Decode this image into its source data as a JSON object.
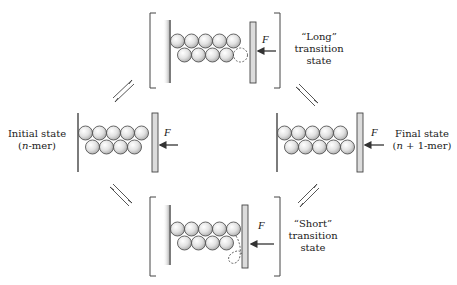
{
  "figure": {
    "type": "reaction-cycle-diagram"
  },
  "states": {
    "initial": {
      "line1": "Initial state",
      "line2": "(n-mer)",
      "line2_prefix": "(",
      "line2_var": "n",
      "line2_suffix": "-mer)",
      "top_row": 5,
      "bottom_row": 4,
      "dashed": 0
    },
    "final": {
      "line1": "Final state",
      "line2_prefix": "(",
      "line2_var": "n",
      "line2_suffix": " + 1-mer)",
      "top_row": 5,
      "bottom_row": 5,
      "dashed": 0
    },
    "long_ts": {
      "line1": "“Long”",
      "line2": "transition",
      "line3": "state",
      "top_row": 5,
      "bottom_row": 4,
      "dashed": 1
    },
    "short_ts": {
      "line1": "“Short”",
      "line2": "transition",
      "line3": "state",
      "top_row": 5,
      "bottom_row": 4,
      "dashed": 1
    }
  },
  "force_label": "F",
  "colors": {
    "ink": "#333333",
    "subunit_fill_light": "#f4f4f4",
    "subunit_fill_dark": "#b8b8b8",
    "plate_fill": "#d9d9d9",
    "wall_shade": "#c8c8c8"
  },
  "arrows": [
    {
      "name": "initial-to-long",
      "kind": "equilibrium"
    },
    {
      "name": "long-to-final",
      "kind": "equilibrium"
    },
    {
      "name": "initial-to-short",
      "kind": "equilibrium"
    },
    {
      "name": "short-to-final",
      "kind": "equilibrium"
    }
  ]
}
